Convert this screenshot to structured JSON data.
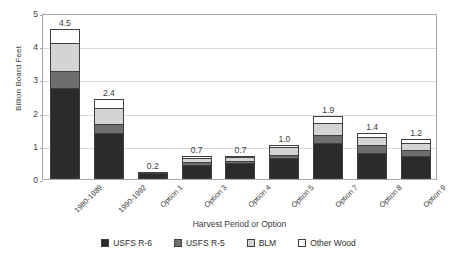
{
  "chart_data": {
    "type": "bar",
    "subtype": "stacked-bar",
    "title": "",
    "xlabel": "Harvest Period or Option",
    "ylabel": "Billion Board Feet",
    "ylim": [
      0,
      5
    ],
    "yticks": [
      0,
      1,
      2,
      3,
      4,
      5
    ],
    "ytick_labels": [
      "0",
      "1",
      "2",
      "3",
      "4",
      "5"
    ],
    "grid": true,
    "grid_axis": "y",
    "legend_position": "bottom",
    "categories": [
      "1980-1989",
      "1990-1992",
      "Option 1",
      "Option 3",
      "Option 4",
      "Option 5",
      "Option 7",
      "Option 8",
      "Option 9"
    ],
    "series": [
      {
        "name": "USFS R-6",
        "color": "#2b2b2b",
        "values": [
          2.75,
          1.4,
          0.19,
          0.41,
          0.47,
          0.62,
          1.08,
          0.77,
          0.7
        ]
      },
      {
        "name": "USFS R-5",
        "color": "#6e6e6e",
        "values": [
          0.5,
          0.27,
          0.0,
          0.09,
          0.06,
          0.1,
          0.24,
          0.24,
          0.17
        ]
      },
      {
        "name": "BLM",
        "color": "#d4d4d4",
        "values": [
          0.85,
          0.47,
          0.0,
          0.14,
          0.12,
          0.23,
          0.37,
          0.26,
          0.22
        ]
      },
      {
        "name": "Other Wood",
        "color": "#ffffff",
        "values": [
          0.43,
          0.26,
          0.01,
          0.06,
          0.05,
          0.08,
          0.2,
          0.13,
          0.11
        ]
      }
    ],
    "totals": [
      4.5,
      2.4,
      0.2,
      0.7,
      0.7,
      1.0,
      1.9,
      1.4,
      1.2
    ],
    "total_labels": [
      "4.5",
      "2.4",
      "0.2",
      "0.7",
      "0.7",
      "1.0",
      "1.9",
      "1.4",
      "1.2"
    ]
  },
  "legend": {
    "items": [
      {
        "label": "USFS R-6",
        "color": "#2b2b2b"
      },
      {
        "label": "USFS R-5",
        "color": "#6e6e6e"
      },
      {
        "label": "BLM",
        "color": "#d4d4d4"
      },
      {
        "label": "Other Wood",
        "color": "#ffffff"
      }
    ]
  },
  "axes": {
    "y_title": "Billion Board Feet",
    "x_title": "Harvest Period or Option"
  }
}
